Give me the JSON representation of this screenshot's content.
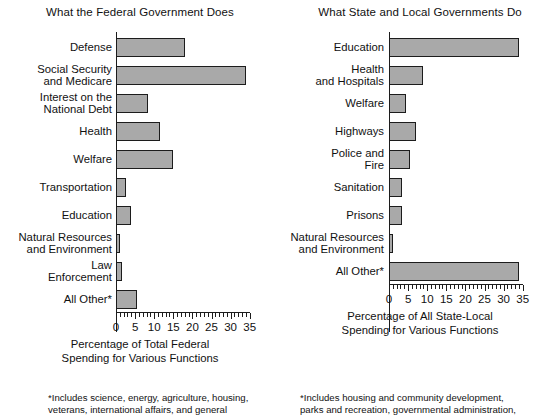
{
  "chart_data": [
    {
      "type": "bar",
      "orientation": "horizontal",
      "title": "What the Federal Government Does",
      "xlabel": "Percentage of Total Federal\nSpending for Various Functions",
      "ylabel": "",
      "xlim": [
        0,
        35
      ],
      "xticks": [
        0,
        5,
        10,
        15,
        20,
        25,
        30,
        35
      ],
      "xtick_labels": [
        "0",
        "5",
        "10",
        "15",
        "20",
        "25",
        "30",
        "35"
      ],
      "minor_tick_step": 1,
      "grid": false,
      "legend": false,
      "bar_color": "#a9a9a9",
      "bar_edge_color": "#1c1c1c",
      "categories": [
        "Defense",
        "Social Security\nand Medicare",
        "Interest on the\nNational Debt",
        "Health",
        "Welfare",
        "Transportation",
        "Education",
        "Natural Resources\nand Environment",
        "Law\nEnforcement",
        "All Other*"
      ],
      "values": [
        18.0,
        34.0,
        8.5,
        11.5,
        15.0,
        2.5,
        4.0,
        1.0,
        1.5,
        5.5
      ],
      "footnote": "*Includes science, energy, agriculture, housing,\nveterans, international affairs, and general"
    },
    {
      "type": "bar",
      "orientation": "horizontal",
      "title": "What State and Local Governments Do",
      "xlabel": "Percentage of All State-Local\nSpending for Various Functions",
      "ylabel": "",
      "xlim": [
        0,
        35
      ],
      "xticks": [
        0,
        5,
        10,
        15,
        20,
        25,
        30,
        35
      ],
      "xtick_labels": [
        "0",
        "5",
        "10",
        "15",
        "20",
        "25",
        "30",
        "35"
      ],
      "minor_tick_step": 1,
      "grid": false,
      "legend": false,
      "bar_color": "#a9a9a9",
      "bar_edge_color": "#1c1c1c",
      "categories": [
        "Education",
        "Health\nand Hospitals",
        "Welfare",
        "Highways",
        "Police and\nFire",
        "Sanitation",
        "Prisons",
        "Natural Resources\nand Environment",
        "All Other*"
      ],
      "values": [
        34.0,
        9.0,
        4.5,
        7.0,
        5.5,
        3.5,
        3.5,
        1.0,
        34.0
      ],
      "footnote": "*Includes housing and community development,\nparks and recreation, governmental administration,"
    }
  ]
}
